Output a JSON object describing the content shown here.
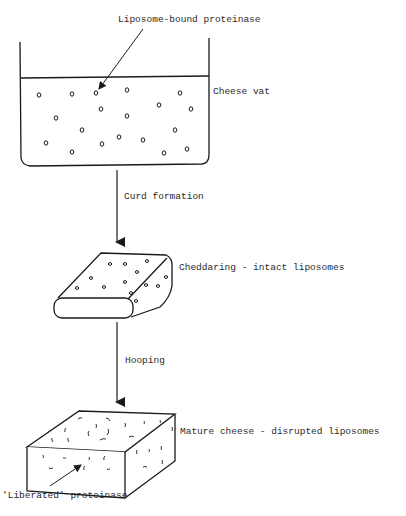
{
  "diagram": {
    "labels": {
      "liposome_bound": "Liposome-bound proteinase",
      "cheese_vat": "Cheese vat",
      "curd_formation": "Curd formation",
      "cheddaring": "Cheddaring - intact liposomes",
      "hooping": "Hooping",
      "mature_cheese": "Mature cheese - disrupted liposomes",
      "liberated": "'Liberated' proteinase"
    },
    "stages": [
      {
        "name": "Cheese vat",
        "description": "Milk in vat with liposome-bound proteinase dispersed"
      },
      {
        "name": "Cheddaring",
        "description": "Curd slab with intact liposomes"
      },
      {
        "name": "Mature cheese",
        "description": "Cheese block with disrupted liposomes releasing proteinase"
      }
    ],
    "transitions": [
      {
        "from": "Cheese vat",
        "to": "Cheddaring",
        "label": "Curd formation"
      },
      {
        "from": "Cheddaring",
        "to": "Mature cheese",
        "label": "Hooping"
      }
    ],
    "colors": {
      "stroke": "#1a1a1a",
      "text": "#2a2a2a",
      "background": "#ffffff"
    },
    "vat_liposomes": [
      [
        39,
        95
      ],
      [
        72,
        94
      ],
      [
        96,
        93
      ],
      [
        127,
        90
      ],
      [
        180,
        93
      ],
      [
        101,
        109
      ],
      [
        159,
        105
      ],
      [
        191,
        109
      ],
      [
        56,
        118
      ],
      [
        127,
        116
      ],
      [
        82,
        130
      ],
      [
        119,
        137
      ],
      [
        143,
        140
      ],
      [
        175,
        130
      ],
      [
        46,
        143
      ],
      [
        72,
        152
      ],
      [
        102,
        144
      ],
      [
        164,
        153
      ],
      [
        187,
        149
      ]
    ],
    "curd_liposomes": [
      [
        110,
        264
      ],
      [
        125,
        264
      ],
      [
        147,
        261
      ],
      [
        137,
        272
      ],
      [
        91,
        278
      ],
      [
        125,
        282
      ],
      [
        166,
        277
      ],
      [
        77,
        288
      ],
      [
        104,
        287
      ],
      [
        146,
        285
      ],
      [
        158,
        286
      ],
      [
        131,
        293
      ],
      [
        136,
        301
      ]
    ]
  }
}
